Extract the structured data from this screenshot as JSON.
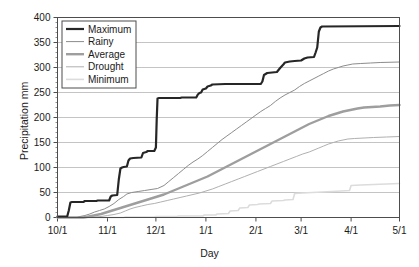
{
  "chart_data": {
    "type": "line",
    "title": "",
    "xlabel": "Day",
    "ylabel": "Precipitation mm",
    "grid": true,
    "legend_position": "top-left",
    "xlim": [
      0,
      212
    ],
    "ylim": [
      0,
      400
    ],
    "ytick_values": [
      0,
      50,
      100,
      150,
      200,
      250,
      300,
      350,
      400
    ],
    "ytick_labels": [
      "0",
      "50",
      "100",
      "150",
      "200",
      "250",
      "300",
      "350",
      "400"
    ],
    "xtick_positions": [
      0,
      31,
      61,
      92,
      123,
      151,
      182,
      212
    ],
    "xtick_labels": [
      "10/1",
      "11/1",
      "12/1",
      "1/1",
      "2/1",
      "3/1",
      "4/1",
      "5/1"
    ],
    "x_unit": "days since 10/1",
    "series": [
      {
        "name": "Maximum",
        "color": "#262626",
        "width": 2.2,
        "final_value": 383,
        "points": [
          [
            0,
            2
          ],
          [
            6,
            2
          ],
          [
            7,
            14
          ],
          [
            8,
            30
          ],
          [
            9,
            31
          ],
          [
            16,
            31
          ],
          [
            17,
            33
          ],
          [
            24,
            33
          ],
          [
            25,
            34
          ],
          [
            32,
            34
          ],
          [
            33,
            42
          ],
          [
            34,
            44
          ],
          [
            37,
            45
          ],
          [
            38,
            76
          ],
          [
            39,
            98
          ],
          [
            40,
            100
          ],
          [
            41,
            101
          ],
          [
            43,
            102
          ],
          [
            44,
            114
          ],
          [
            45,
            118
          ],
          [
            47,
            119
          ],
          [
            52,
            120
          ],
          [
            53,
            129
          ],
          [
            55,
            131
          ],
          [
            56,
            133
          ],
          [
            60,
            133
          ],
          [
            61,
            140
          ],
          [
            61.5,
            196
          ],
          [
            62,
            238
          ],
          [
            63,
            239
          ],
          [
            76,
            239
          ],
          [
            77,
            240
          ],
          [
            86,
            240
          ],
          [
            87,
            246
          ],
          [
            88,
            249
          ],
          [
            89,
            250
          ],
          [
            90,
            256
          ],
          [
            92,
            258
          ],
          [
            93,
            262
          ],
          [
            95,
            264
          ],
          [
            96,
            266
          ],
          [
            104,
            267
          ],
          [
            105,
            267
          ],
          [
            126,
            267
          ],
          [
            127,
            272
          ],
          [
            128,
            285
          ],
          [
            130,
            289
          ],
          [
            133,
            290
          ],
          [
            136,
            291
          ],
          [
            138,
            299
          ],
          [
            140,
            306
          ],
          [
            141,
            310
          ],
          [
            144,
            312
          ],
          [
            147,
            313
          ],
          [
            151,
            314
          ],
          [
            153,
            318
          ],
          [
            155,
            320
          ],
          [
            159,
            321
          ],
          [
            160,
            330
          ],
          [
            161,
            340
          ],
          [
            162,
            372
          ],
          [
            163,
            380
          ],
          [
            164,
            382
          ],
          [
            212,
            383
          ]
        ]
      },
      {
        "name": "Rainy",
        "color": "#8c8c8c",
        "width": 1.0,
        "final_value": 311,
        "points": [
          [
            0,
            0
          ],
          [
            12,
            0
          ],
          [
            14,
            2
          ],
          [
            17,
            4
          ],
          [
            20,
            7
          ],
          [
            23,
            11
          ],
          [
            26,
            14
          ],
          [
            29,
            17
          ],
          [
            32,
            22
          ],
          [
            35,
            28
          ],
          [
            38,
            36
          ],
          [
            41,
            42
          ],
          [
            43,
            47
          ],
          [
            46,
            50
          ],
          [
            50,
            52
          ],
          [
            54,
            54
          ],
          [
            58,
            56
          ],
          [
            62,
            58
          ],
          [
            66,
            64
          ],
          [
            69,
            72
          ],
          [
            72,
            80
          ],
          [
            75,
            88
          ],
          [
            78,
            96
          ],
          [
            81,
            104
          ],
          [
            84,
            111
          ],
          [
            87,
            117
          ],
          [
            90,
            124
          ],
          [
            93,
            132
          ],
          [
            96,
            140
          ],
          [
            99,
            148
          ],
          [
            102,
            156
          ],
          [
            105,
            163
          ],
          [
            108,
            170
          ],
          [
            111,
            177
          ],
          [
            114,
            184
          ],
          [
            117,
            191
          ],
          [
            120,
            198
          ],
          [
            123,
            205
          ],
          [
            126,
            212
          ],
          [
            129,
            218
          ],
          [
            132,
            224
          ],
          [
            135,
            232
          ],
          [
            138,
            239
          ],
          [
            141,
            245
          ],
          [
            144,
            250
          ],
          [
            147,
            255
          ],
          [
            150,
            262
          ],
          [
            153,
            268
          ],
          [
            156,
            273
          ],
          [
            159,
            278
          ],
          [
            162,
            283
          ],
          [
            165,
            288
          ],
          [
            168,
            293
          ],
          [
            171,
            297
          ],
          [
            174,
            300
          ],
          [
            177,
            303
          ],
          [
            180,
            305
          ],
          [
            183,
            307
          ],
          [
            188,
            308
          ],
          [
            194,
            309
          ],
          [
            200,
            310
          ],
          [
            212,
            311
          ]
        ]
      },
      {
        "name": "Average",
        "color": "#9e9e9e",
        "width": 2.4,
        "final_value": 225,
        "points": [
          [
            0,
            0
          ],
          [
            16,
            0
          ],
          [
            18,
            1
          ],
          [
            21,
            3
          ],
          [
            24,
            5
          ],
          [
            27,
            7
          ],
          [
            30,
            10
          ],
          [
            33,
            13
          ],
          [
            36,
            16
          ],
          [
            39,
            19
          ],
          [
            42,
            22
          ],
          [
            45,
            25
          ],
          [
            48,
            28
          ],
          [
            51,
            31
          ],
          [
            54,
            34
          ],
          [
            57,
            37
          ],
          [
            60,
            40
          ],
          [
            63,
            43
          ],
          [
            66,
            46
          ],
          [
            69,
            50
          ],
          [
            72,
            54
          ],
          [
            75,
            58
          ],
          [
            78,
            62
          ],
          [
            81,
            66
          ],
          [
            84,
            70
          ],
          [
            87,
            74
          ],
          [
            90,
            78
          ],
          [
            93,
            82
          ],
          [
            96,
            87
          ],
          [
            99,
            92
          ],
          [
            102,
            97
          ],
          [
            105,
            102
          ],
          [
            108,
            107
          ],
          [
            111,
            112
          ],
          [
            114,
            117
          ],
          [
            117,
            122
          ],
          [
            120,
            127
          ],
          [
            123,
            132
          ],
          [
            126,
            137
          ],
          [
            129,
            142
          ],
          [
            132,
            147
          ],
          [
            135,
            152
          ],
          [
            138,
            157
          ],
          [
            141,
            162
          ],
          [
            144,
            167
          ],
          [
            147,
            172
          ],
          [
            150,
            177
          ],
          [
            153,
            182
          ],
          [
            156,
            187
          ],
          [
            159,
            191
          ],
          [
            162,
            195
          ],
          [
            165,
            199
          ],
          [
            168,
            203
          ],
          [
            171,
            206
          ],
          [
            174,
            209
          ],
          [
            177,
            212
          ],
          [
            180,
            214
          ],
          [
            183,
            216
          ],
          [
            186,
            218
          ],
          [
            190,
            220
          ],
          [
            195,
            221
          ],
          [
            200,
            222
          ],
          [
            206,
            224
          ],
          [
            212,
            225
          ]
        ]
      },
      {
        "name": "Drought",
        "color": "#b0b0b0",
        "width": 1.0,
        "final_value": 162,
        "points": [
          [
            0,
            0
          ],
          [
            20,
            0
          ],
          [
            23,
            1
          ],
          [
            27,
            2
          ],
          [
            31,
            4
          ],
          [
            35,
            6
          ],
          [
            39,
            9
          ],
          [
            42,
            13
          ],
          [
            45,
            17
          ],
          [
            48,
            20
          ],
          [
            52,
            23
          ],
          [
            56,
            26
          ],
          [
            60,
            28
          ],
          [
            64,
            31
          ],
          [
            68,
            34
          ],
          [
            72,
            37
          ],
          [
            76,
            40
          ],
          [
            80,
            43
          ],
          [
            84,
            46
          ],
          [
            88,
            49
          ],
          [
            92,
            53
          ],
          [
            96,
            57
          ],
          [
            100,
            62
          ],
          [
            104,
            67
          ],
          [
            108,
            72
          ],
          [
            112,
            77
          ],
          [
            116,
            82
          ],
          [
            120,
            87
          ],
          [
            124,
            92
          ],
          [
            128,
            97
          ],
          [
            132,
            102
          ],
          [
            136,
            107
          ],
          [
            140,
            112
          ],
          [
            144,
            117
          ],
          [
            148,
            122
          ],
          [
            152,
            127
          ],
          [
            156,
            131
          ],
          [
            159,
            135
          ],
          [
            162,
            139
          ],
          [
            165,
            143
          ],
          [
            168,
            147
          ],
          [
            171,
            150
          ],
          [
            174,
            153
          ],
          [
            177,
            155
          ],
          [
            180,
            157
          ],
          [
            184,
            158
          ],
          [
            190,
            159
          ],
          [
            196,
            160
          ],
          [
            204,
            161
          ],
          [
            212,
            162
          ]
        ]
      },
      {
        "name": "Minimum",
        "color": "#dcdcdc",
        "width": 1.6,
        "final_value": 68,
        "points": [
          [
            0,
            0
          ],
          [
            41,
            0
          ],
          [
            42,
            1
          ],
          [
            60,
            1
          ],
          [
            61,
            2
          ],
          [
            74,
            2
          ],
          [
            75,
            3
          ],
          [
            90,
            3
          ],
          [
            91,
            5
          ],
          [
            98,
            5
          ],
          [
            99,
            7
          ],
          [
            106,
            8
          ],
          [
            107,
            13
          ],
          [
            112,
            14
          ],
          [
            113,
            19
          ],
          [
            118,
            20
          ],
          [
            119,
            25
          ],
          [
            124,
            26
          ],
          [
            125,
            27
          ],
          [
            132,
            28
          ],
          [
            133,
            33
          ],
          [
            140,
            34
          ],
          [
            141,
            35
          ],
          [
            146,
            36
          ],
          [
            147,
            48
          ],
          [
            152,
            49
          ],
          [
            158,
            50
          ],
          [
            164,
            51
          ],
          [
            170,
            52
          ],
          [
            176,
            53
          ],
          [
            181,
            54
          ],
          [
            182,
            64
          ],
          [
            188,
            65
          ],
          [
            196,
            66
          ],
          [
            204,
            67
          ],
          [
            212,
            68
          ]
        ]
      }
    ]
  },
  "legend": {
    "items": [
      {
        "label": "Maximum"
      },
      {
        "label": "Rainy"
      },
      {
        "label": "Average"
      },
      {
        "label": "Drought"
      },
      {
        "label": "Minimum"
      }
    ]
  }
}
